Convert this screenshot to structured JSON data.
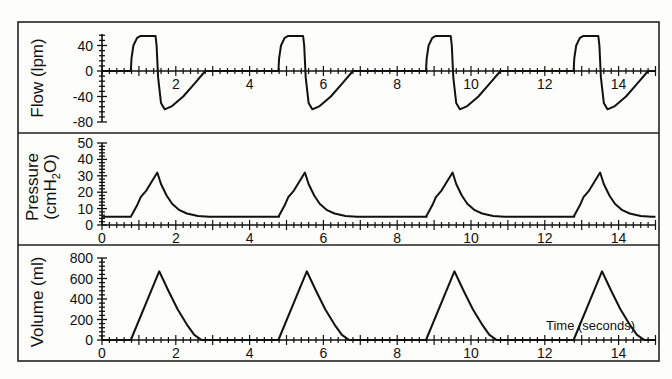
{
  "chart_data": [
    {
      "type": "line",
      "panel": "flow",
      "ylabel": "Flow (lpm)",
      "yticks": [
        40,
        0,
        -40,
        -80
      ],
      "ylim": [
        -80,
        60
      ],
      "xlim": [
        0,
        15
      ],
      "xticks": [
        2,
        4,
        6,
        8,
        10,
        12,
        14
      ],
      "grid": false,
      "x": [
        0,
        0.78,
        0.8,
        0.85,
        0.95,
        1.05,
        1.45,
        1.48,
        1.52,
        1.6,
        1.7,
        1.9,
        2.2,
        2.5,
        2.8,
        4.8
      ],
      "values": [
        0,
        0,
        20,
        40,
        52,
        55,
        55,
        40,
        -10,
        -50,
        -60,
        -55,
        -40,
        -20,
        0,
        0
      ],
      "period": 4,
      "cycles": 4
    },
    {
      "type": "line",
      "panel": "pressure",
      "ylabel": "Pressure (cmH2O)",
      "yticks": [
        50,
        40,
        30,
        20,
        10,
        0
      ],
      "ylim": [
        0,
        50
      ],
      "xlim": [
        0,
        15
      ],
      "xticks": [
        0,
        2,
        4,
        6,
        8,
        10,
        12,
        14
      ],
      "grid": false,
      "x": [
        0,
        0.78,
        0.95,
        1.05,
        1.2,
        1.5,
        1.6,
        1.75,
        1.9,
        2.1,
        2.3,
        2.6,
        2.9,
        4.8
      ],
      "values": [
        5,
        5,
        12,
        17,
        21,
        32,
        25,
        18,
        13,
        9,
        7,
        5.5,
        5,
        5
      ],
      "period": 4,
      "cycles": 4
    },
    {
      "type": "line",
      "panel": "volume",
      "ylabel": "Volume (ml)",
      "xlabel": "Time (seconds)",
      "yticks": [
        800,
        600,
        400,
        200,
        0
      ],
      "ylim": [
        0,
        800
      ],
      "xlim": [
        0,
        15
      ],
      "xticks": [
        0,
        2,
        4,
        6,
        8,
        10,
        12,
        14
      ],
      "grid": false,
      "x": [
        0,
        0.78,
        1.55,
        1.8,
        2.05,
        2.3,
        2.5,
        2.7,
        4.8
      ],
      "values": [
        0,
        0,
        670,
        480,
        300,
        150,
        50,
        0,
        0
      ],
      "period": 4,
      "cycles": 4
    }
  ],
  "labels": {
    "flow": "Flow (lpm)",
    "pressure_line1": "Pressure",
    "pressure_line2": "(cmH",
    "pressure_sub": "2",
    "pressure_end": "O)",
    "volume": "Volume (ml)",
    "time": "Time (seconds)"
  }
}
